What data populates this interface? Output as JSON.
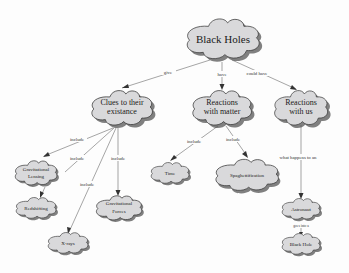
{
  "diagram": {
    "type": "concept-map",
    "nodes": {
      "black_holes": {
        "label": "Black Holes"
      },
      "clues_l1": {
        "label": "Clues to their"
      },
      "clues_l2": {
        "label": "existance"
      },
      "matter_l1": {
        "label": "Reactions"
      },
      "matter_l2": {
        "label": "with matter"
      },
      "us_l1": {
        "label": "Reactions"
      },
      "us_l2": {
        "label": "with us"
      },
      "lensing_l1": {
        "label": "Gravitational"
      },
      "lensing_l2": {
        "label": "Lensing"
      },
      "redshifting": {
        "label": "Redshifting"
      },
      "xrays": {
        "label": "X-rays"
      },
      "forces_l1": {
        "label": "Gravitational"
      },
      "forces_l2": {
        "label": "Forces"
      },
      "time": {
        "label": "Time"
      },
      "spaghetti": {
        "label": "Spaghettification"
      },
      "astronaut": {
        "label": "Astronaut"
      },
      "black_hole": {
        "label": "Black Hole"
      }
    },
    "edges": {
      "give": "give",
      "have": "have",
      "could_have": "could have",
      "include_lensing": "include",
      "include_redshift": "include",
      "include_xrays": "include",
      "include_forces": "include",
      "include_time": "include",
      "include_spaghetti": "include",
      "what_happens": "what happens to an",
      "goes_into": "goes into a"
    }
  }
}
